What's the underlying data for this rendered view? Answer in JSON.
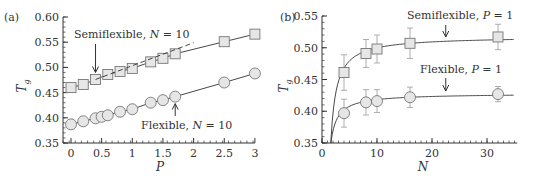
{
  "chart_data": [
    {
      "panel": "(a)",
      "type": "line",
      "xlabel": "P",
      "ylabel": "Tg",
      "xlim": [
        -0.1,
        3.0
      ],
      "ylim": [
        0.35,
        0.6
      ],
      "xticks": [
        "0",
        "0.5",
        "1",
        "1.5",
        "2",
        "2.5",
        "3"
      ],
      "yticks": [
        "0.35",
        "0.40",
        "0.45",
        "0.50",
        "0.55",
        "0.60"
      ],
      "grid": false,
      "series": [
        {
          "name": "Semiflexible, N = 10",
          "marker": "square",
          "x": [
            0,
            0.2,
            0.4,
            0.6,
            0.8,
            1.0,
            1.3,
            1.5,
            1.7,
            2.5,
            3.0
          ],
          "y": [
            0.46,
            0.466,
            0.476,
            0.486,
            0.492,
            0.498,
            0.511,
            0.518,
            0.527,
            0.551,
            0.566
          ]
        },
        {
          "name": "Flexible, N = 10",
          "marker": "circle",
          "x": [
            0,
            0.2,
            0.4,
            0.5,
            0.6,
            0.8,
            1.0,
            1.3,
            1.5,
            1.7,
            2.5,
            3.0
          ],
          "y": [
            0.387,
            0.393,
            0.399,
            0.402,
            0.405,
            0.412,
            0.417,
            0.43,
            0.435,
            0.442,
            0.47,
            0.488
          ]
        },
        {
          "name": "linear extrapolation (dashed)",
          "style": "dashed",
          "x": [
            0.4,
            2.0
          ],
          "y": [
            0.476,
            0.549
          ]
        }
      ],
      "annotations": [
        {
          "text": "Semiflexible, N = 10",
          "arrow_to": [
            0.4,
            0.476
          ]
        },
        {
          "text": "Flexible, N = 10",
          "arrow_to": [
            1.7,
            0.442
          ]
        }
      ]
    },
    {
      "panel": "(b)",
      "type": "line",
      "xlabel": "N",
      "ylabel": "Tg",
      "xlim": [
        0,
        35
      ],
      "ylim": [
        0.35,
        0.55
      ],
      "xticks": [
        "0",
        "10",
        "20",
        "30"
      ],
      "yticks": [
        "0.35",
        "0.40",
        "0.45",
        "0.50",
        "0.55"
      ],
      "grid": false,
      "series": [
        {
          "name": "Semiflexible, P = 1",
          "marker": "square",
          "x": [
            4,
            8,
            10,
            16,
            32
          ],
          "y": [
            0.461,
            0.491,
            0.498,
            0.507,
            0.517
          ],
          "yerr": [
            0.028,
            0.022,
            0.022,
            0.024,
            0.02
          ]
        },
        {
          "name": "Flexible, P = 1",
          "marker": "circle",
          "x": [
            4,
            8,
            10,
            16,
            32
          ],
          "y": [
            0.397,
            0.414,
            0.416,
            0.422,
            0.427
          ],
          "yerr": [
            0.022,
            0.02,
            0.018,
            0.016,
            0.012
          ]
        }
      ],
      "fit_curves": [
        {
          "name": "Semiflexible fit",
          "asymptote": 0.518,
          "start_x": 1.6
        },
        {
          "name": "Flexible fit",
          "asymptote": 0.428,
          "start_x": 1.6
        }
      ],
      "annotations": [
        {
          "text": "Semiflexible, P = 1",
          "arrow_to": [
            22.5,
            0.513
          ]
        },
        {
          "text": "Flexible, P = 1",
          "arrow_to": [
            22.5,
            0.424
          ]
        }
      ]
    }
  ],
  "labels": {
    "panel_a": "(a)",
    "panel_b": "(b)",
    "a_xlabel": "P",
    "b_xlabel": "N",
    "ylabel_main": "T",
    "ylabel_sub": "g",
    "a_semi_pre": "Semiflexible, ",
    "a_semi_var": "N",
    "a_semi_post": " = 10",
    "a_flex_pre": "Flexible, ",
    "a_flex_var": "N",
    "a_flex_post": " = 10",
    "b_semi_pre": "Semiflexible, ",
    "b_semi_var": "P",
    "b_semi_post": " = 1",
    "b_flex_pre": "Flexible, ",
    "b_flex_var": "P",
    "b_flex_post": " = 1"
  },
  "colors": {
    "axis": "#333333",
    "line": "#333333",
    "marker_fill": "#e6e6e6",
    "marker_stroke": "#777777",
    "errorbar": "#9a9a9a"
  }
}
